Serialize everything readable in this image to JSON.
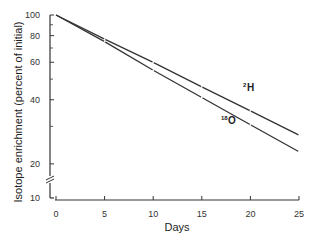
{
  "chart_data": {
    "type": "line",
    "title": "",
    "xlabel": "Days",
    "ylabel": "Isotope enrichment (percent of initial)",
    "yscale": "log",
    "ylim": [
      10,
      100
    ],
    "xlim": [
      0,
      25
    ],
    "x_ticks": [
      0,
      5,
      10,
      15,
      20,
      25
    ],
    "y_ticks": [
      10,
      20,
      40,
      60,
      80,
      100
    ],
    "y_axis_break": true,
    "grid": false,
    "legend": "inline labels",
    "x": [
      0,
      5,
      10,
      15,
      20,
      25
    ],
    "series": [
      {
        "name": "2H",
        "label_sup": "2",
        "label_main": "H",
        "values": [
          100,
          77,
          60,
          46,
          35.5,
          27.3
        ]
      },
      {
        "name": "18O",
        "label_sup": "18",
        "label_main": "O",
        "values": [
          100,
          75,
          55,
          41,
          30.5,
          22.8
        ]
      }
    ]
  }
}
